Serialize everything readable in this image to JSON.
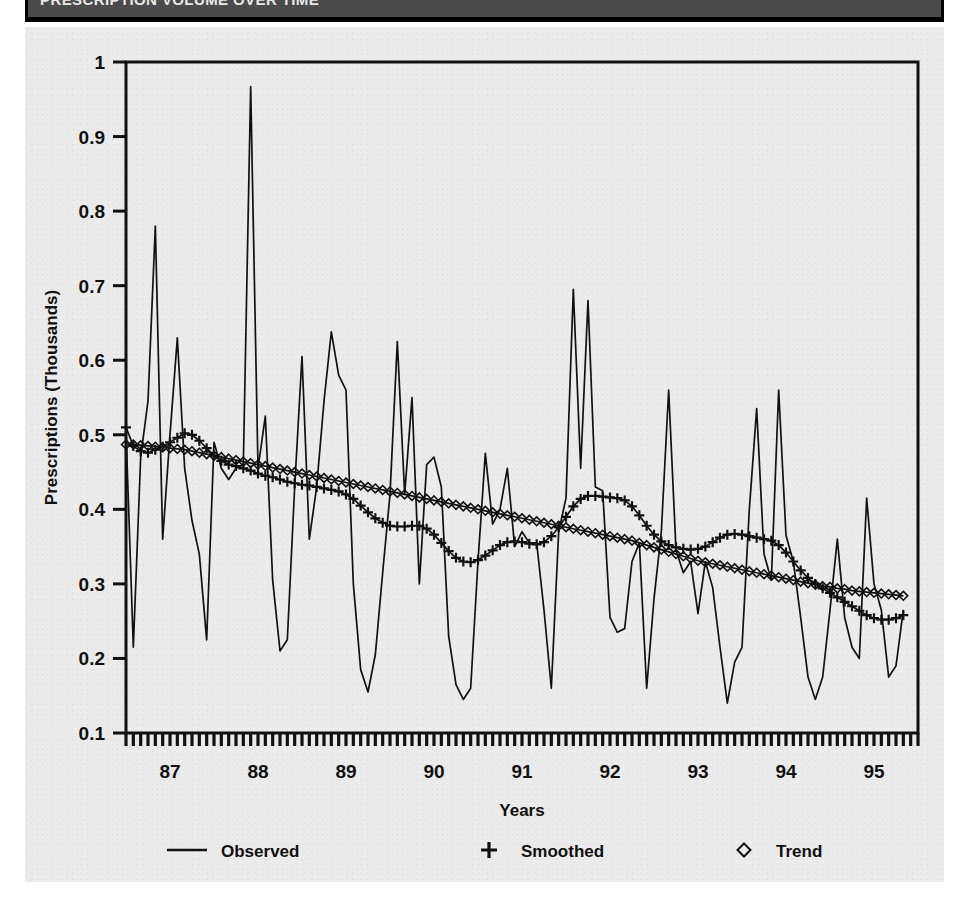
{
  "header": {
    "title": "PRESCRIPTION VOLUME OVER TIME"
  },
  "figure": {
    "background_color": "#ebebeb",
    "ink_color": "#111111"
  },
  "chart_data": {
    "type": "line",
    "title": "",
    "xlabel": "Years",
    "ylabel": "Prescriptions (Thousands)",
    "xlim": [
      1986.5,
      1995.5
    ],
    "ylim": [
      0.1,
      1.0
    ],
    "grid": false,
    "legend_position": "bottom",
    "y_ticks": [
      "0.1",
      "0.2",
      "0.3",
      "0.4",
      "0.5",
      "0.6",
      "0.7",
      "0.8",
      "0.9",
      "1"
    ],
    "y_tick_values": [
      0.1,
      0.2,
      0.3,
      0.4,
      0.5,
      0.6,
      0.7,
      0.8,
      0.9,
      1.0
    ],
    "x_ticks": [
      "87",
      "88",
      "89",
      "90",
      "91",
      "92",
      "93",
      "94",
      "95"
    ],
    "x_tick_values": [
      1987,
      1988,
      1989,
      1990,
      1991,
      1992,
      1993,
      1994,
      1995
    ],
    "x_minor_tick_interval_months": 1,
    "x_start": 1986.5,
    "x_step": 0.0833333,
    "legend": [
      {
        "name": "Observed",
        "marker": "line"
      },
      {
        "name": "Smoothed",
        "marker": "plus"
      },
      {
        "name": "Trend",
        "marker": "diamond"
      }
    ],
    "series": [
      {
        "name": "Observed",
        "marker": "line",
        "values": [
          0.505,
          0.215,
          0.47,
          0.545,
          0.78,
          0.36,
          0.5,
          0.63,
          0.455,
          0.385,
          0.34,
          0.225,
          0.49,
          0.455,
          0.44,
          0.455,
          0.46,
          0.967,
          0.455,
          0.525,
          0.305,
          0.21,
          0.225,
          0.43,
          0.605,
          0.36,
          0.43,
          0.545,
          0.638,
          0.58,
          0.56,
          0.3,
          0.185,
          0.155,
          0.205,
          0.315,
          0.42,
          0.625,
          0.42,
          0.55,
          0.3,
          0.46,
          0.47,
          0.43,
          0.23,
          0.165,
          0.145,
          0.16,
          0.33,
          0.475,
          0.38,
          0.4,
          0.455,
          0.35,
          0.37,
          0.355,
          0.355,
          0.265,
          0.16,
          0.37,
          0.415,
          0.695,
          0.455,
          0.68,
          0.43,
          0.425,
          0.255,
          0.235,
          0.24,
          0.33,
          0.355,
          0.16,
          0.28,
          0.37,
          0.56,
          0.345,
          0.315,
          0.33,
          0.26,
          0.33,
          0.295,
          0.215,
          0.14,
          0.195,
          0.215,
          0.4,
          0.535,
          0.34,
          0.305,
          0.56,
          0.365,
          0.33,
          0.255,
          0.175,
          0.145,
          0.175,
          0.265,
          0.36,
          0.255,
          0.215,
          0.2,
          0.415,
          0.3,
          0.265,
          0.175,
          0.19,
          0.265
        ]
      },
      {
        "name": "Smoothed",
        "marker": "plus",
        "values": [
          0.51,
          0.485,
          0.478,
          0.476,
          0.48,
          0.484,
          0.49,
          0.496,
          0.502,
          0.5,
          0.492,
          0.482,
          0.472,
          0.465,
          0.46,
          0.458,
          0.455,
          0.452,
          0.448,
          0.445,
          0.443,
          0.44,
          0.437,
          0.435,
          0.433,
          0.432,
          0.43,
          0.428,
          0.426,
          0.424,
          0.42,
          0.414,
          0.405,
          0.396,
          0.388,
          0.382,
          0.378,
          0.377,
          0.377,
          0.378,
          0.378,
          0.374,
          0.366,
          0.355,
          0.344,
          0.335,
          0.33,
          0.329,
          0.332,
          0.338,
          0.345,
          0.352,
          0.356,
          0.357,
          0.356,
          0.354,
          0.353,
          0.356,
          0.364,
          0.376,
          0.39,
          0.404,
          0.414,
          0.418,
          0.418,
          0.417,
          0.416,
          0.415,
          0.412,
          0.404,
          0.392,
          0.378,
          0.366,
          0.357,
          0.352,
          0.349,
          0.347,
          0.346,
          0.347,
          0.35,
          0.356,
          0.362,
          0.366,
          0.367,
          0.366,
          0.364,
          0.362,
          0.36,
          0.358,
          0.352,
          0.342,
          0.33,
          0.318,
          0.308,
          0.3,
          0.294,
          0.288,
          0.282,
          0.276,
          0.27,
          0.264,
          0.258,
          0.254,
          0.252,
          0.252,
          0.254,
          0.258
        ]
      },
      {
        "name": "Trend",
        "marker": "diamond",
        "values": [
          0.487,
          0.487,
          0.486,
          0.485,
          0.484,
          0.483,
          0.482,
          0.481,
          0.48,
          0.478,
          0.476,
          0.474,
          0.472,
          0.47,
          0.468,
          0.466,
          0.464,
          0.462,
          0.46,
          0.458,
          0.456,
          0.454,
          0.452,
          0.45,
          0.448,
          0.446,
          0.444,
          0.442,
          0.44,
          0.438,
          0.436,
          0.434,
          0.432,
          0.43,
          0.428,
          0.426,
          0.424,
          0.422,
          0.42,
          0.418,
          0.416,
          0.414,
          0.412,
          0.41,
          0.408,
          0.406,
          0.404,
          0.402,
          0.4,
          0.398,
          0.396,
          0.394,
          0.392,
          0.39,
          0.388,
          0.386,
          0.384,
          0.382,
          0.38,
          0.378,
          0.376,
          0.374,
          0.372,
          0.37,
          0.368,
          0.366,
          0.364,
          0.362,
          0.36,
          0.358,
          0.355,
          0.352,
          0.349,
          0.346,
          0.343,
          0.34,
          0.337,
          0.334,
          0.331,
          0.329,
          0.327,
          0.325,
          0.323,
          0.321,
          0.319,
          0.317,
          0.315,
          0.313,
          0.311,
          0.309,
          0.307,
          0.305,
          0.303,
          0.301,
          0.299,
          0.297,
          0.296,
          0.294,
          0.293,
          0.291,
          0.29,
          0.289,
          0.288,
          0.287,
          0.286,
          0.285,
          0.284
        ]
      }
    ]
  }
}
